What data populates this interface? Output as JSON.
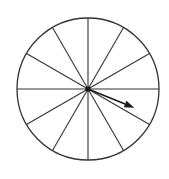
{
  "diagram": {
    "type": "spinner",
    "sections": 12,
    "center": {
      "x": 88,
      "y": 89
    },
    "radius": 71,
    "divider_angles_deg": [
      0,
      30,
      60,
      90,
      120,
      150,
      180,
      210,
      240,
      270,
      300,
      330
    ],
    "arrow": {
      "angle_deg_below_horizontal": 22,
      "length": 50,
      "pointing": "right-down, between the 0° and 330° dividers"
    },
    "colors": {
      "stroke": "#333333",
      "background": "#ffffff",
      "arrow": "#1a1a1a"
    }
  }
}
